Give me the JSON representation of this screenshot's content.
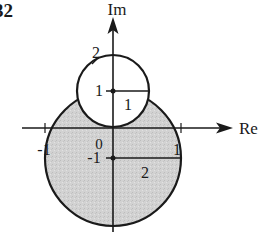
{
  "figure": {
    "number_label": "32"
  },
  "axes": {
    "real_label": "Re",
    "imag_label": "Im",
    "origin_label": "0",
    "re_tick_neg": "-1",
    "re_tick_pos": "1"
  },
  "small_circle": {
    "center_label": "1",
    "radius_label": "1",
    "diameter_label": "2",
    "fill": "#ffffff"
  },
  "large_circle": {
    "center_label": "-1",
    "radius_label": "2",
    "fill": "#cfcfcf"
  },
  "colors": {
    "stroke": "#1a1a1a",
    "shade": "#cfcfcf"
  }
}
